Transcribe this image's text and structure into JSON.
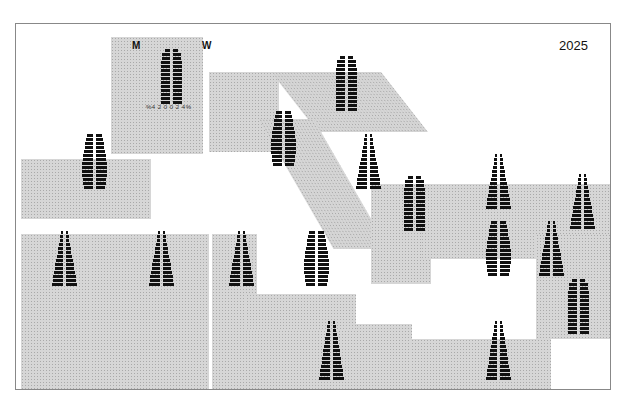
{
  "map": {
    "year_label": "2025",
    "legend": {
      "men_label": "M",
      "women_label": "W",
      "axis_label": "%4 2 0 0 2 4%"
    }
  },
  "colors": {
    "region_fill": "#d6d6d6",
    "bar_fill": "#111111",
    "frame_border": "#888888"
  },
  "pyramids": [
    {
      "id": "legend",
      "cx": 155,
      "top": 25,
      "rows": 14,
      "shape": "column"
    },
    {
      "id": "p2",
      "cx": 330,
      "top": 32,
      "rows": 14,
      "shape": "column"
    },
    {
      "id": "p3",
      "cx": 267,
      "top": 87,
      "rows": 14,
      "shape": "bulge"
    },
    {
      "id": "p4",
      "cx": 78,
      "top": 110,
      "rows": 14,
      "shape": "bulge"
    },
    {
      "id": "p5",
      "cx": 352,
      "top": 110,
      "rows": 14,
      "shape": "triangle"
    },
    {
      "id": "p6",
      "cx": 398,
      "top": 152,
      "rows": 14,
      "shape": "column"
    },
    {
      "id": "p7",
      "cx": 482,
      "top": 130,
      "rows": 14,
      "shape": "triangle"
    },
    {
      "id": "p8",
      "cx": 566,
      "top": 150,
      "rows": 14,
      "shape": "triangle"
    },
    {
      "id": "p9",
      "cx": 48,
      "top": 207,
      "rows": 14,
      "shape": "triangle"
    },
    {
      "id": "p10",
      "cx": 145,
      "top": 207,
      "rows": 14,
      "shape": "triangle"
    },
    {
      "id": "p11",
      "cx": 225,
      "top": 207,
      "rows": 14,
      "shape": "triangle"
    },
    {
      "id": "p12",
      "cx": 300,
      "top": 207,
      "rows": 14,
      "shape": "bulge"
    },
    {
      "id": "p13",
      "cx": 482,
      "top": 197,
      "rows": 14,
      "shape": "bulge"
    },
    {
      "id": "p14",
      "cx": 535,
      "top": 197,
      "rows": 14,
      "shape": "triangle"
    },
    {
      "id": "p15",
      "cx": 562,
      "top": 255,
      "rows": 14,
      "shape": "column"
    },
    {
      "id": "p16",
      "cx": 315,
      "top": 297,
      "rows": 15,
      "shape": "triangle"
    },
    {
      "id": "p17",
      "cx": 482,
      "top": 297,
      "rows": 15,
      "shape": "triangle"
    }
  ]
}
